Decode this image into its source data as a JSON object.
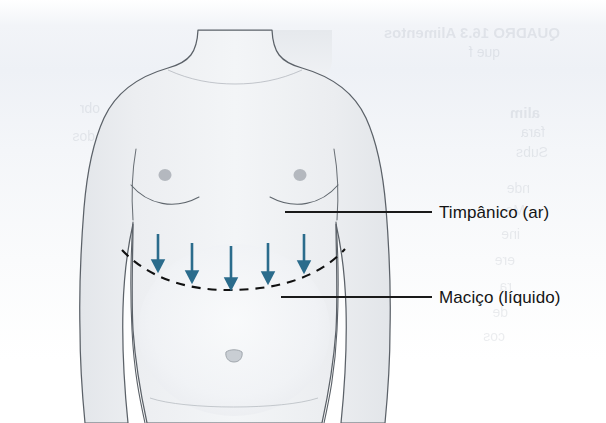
{
  "figure": {
    "background_color": "#f1f4f8",
    "paper_color": "#ffffff"
  },
  "labels": {
    "tympanic": "Timpânico (ar)",
    "dull": "Maciço (líquido)"
  },
  "colors": {
    "arrow": "#2b6c8c",
    "dashed_line": "#111111",
    "leader_line": "#1a1a1a",
    "skin_fill": "#e9ebee",
    "skin_outline": "#5b6168",
    "label_text": "#141414"
  },
  "arrows": {
    "count": 5,
    "direction": "down",
    "color": "#2b6c8c",
    "items": [
      {
        "x": 158,
        "y_start": 234,
        "y_end": 270
      },
      {
        "x": 192,
        "y_start": 243,
        "y_end": 281
      },
      {
        "x": 231,
        "y_start": 246,
        "y_end": 288
      },
      {
        "x": 268,
        "y_start": 243,
        "y_end": 282
      },
      {
        "x": 304,
        "y_start": 234,
        "y_end": 271
      }
    ]
  },
  "dashed_curve": {
    "description": "Linha tracejada curva marcando o nivel de macicez",
    "x_start": 122,
    "x_end": 345,
    "y_lowest": 288,
    "style": "dashed",
    "color": "#111111"
  },
  "leader_lines": [
    {
      "name": "tympanic-leader",
      "x1": 285,
      "y1": 212,
      "x2": 432,
      "y2": 212
    },
    {
      "name": "dull-leader",
      "x1": 281,
      "y1": 297,
      "x2": 432,
      "y2": 297
    }
  ],
  "anatomy": {
    "navel": {
      "x": 233,
      "y": 357
    },
    "nipple_left": {
      "x": 165,
      "y": 175
    },
    "nipple_right": {
      "x": 300,
      "y": 175
    },
    "neck_left_x": 196,
    "neck_right_x": 334
  },
  "bleed_through": [
    {
      "text": "QUADRO 16.3    Alimentos",
      "x": 330,
      "y": 30,
      "size": 15,
      "weight": "bold"
    },
    {
      "text": "que f",
      "x": 338,
      "y": 50,
      "size": 14,
      "weight": "normal"
    },
    {
      "text": "alim",
      "x": 150,
      "y": 108,
      "size": 15,
      "weight": "bold"
    },
    {
      "text": "fara",
      "x": 190,
      "y": 126,
      "size": 14,
      "weight": "normal"
    },
    {
      "text": "Subs",
      "x": 200,
      "y": 144,
      "size": 14,
      "weight": "normal"
    },
    {
      "text": "nde",
      "x": 175,
      "y": 180,
      "size": 14,
      "weight": "normal"
    },
    {
      "text": "Me",
      "x": 205,
      "y": 200,
      "size": 14,
      "weight": "normal"
    },
    {
      "text": "ine",
      "x": 190,
      "y": 225,
      "size": 14,
      "weight": "normal"
    },
    {
      "text": "ere",
      "x": 185,
      "y": 252,
      "size": 14,
      "weight": "normal"
    },
    {
      "text": "ra",
      "x": 215,
      "y": 280,
      "size": 14,
      "weight": "normal"
    },
    {
      "text": "de",
      "x": 210,
      "y": 305,
      "size": 14,
      "weight": "normal"
    },
    {
      "text": "cos",
      "x": 195,
      "y": 330,
      "size": 14,
      "weight": "normal"
    },
    {
      "text": "obr",
      "x": 200,
      "y": 352,
      "size": 14,
      "weight": "normal"
    },
    {
      "text": "dos",
      "x": 190,
      "y": 375,
      "size": 14,
      "weight": "normal"
    }
  ]
}
